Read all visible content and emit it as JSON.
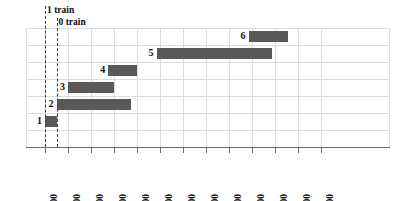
{
  "chart_data": {
    "type": "bar",
    "orientation": "horizontal",
    "title": "",
    "xlabel": "",
    "ylabel": "",
    "grid": true,
    "legend_position": "none",
    "x_axis": {
      "tick_labels": [
        "9:00",
        "10:00",
        "11:00",
        "12:00",
        "13:00",
        "14:00",
        "15:00",
        "16:00",
        "17:00",
        "18:00",
        "19:00",
        "20:00",
        "21:00"
      ],
      "tick_values": [
        9,
        10,
        11,
        12,
        13,
        14,
        15,
        16,
        17,
        18,
        19,
        20,
        21
      ],
      "range": [
        9,
        21.5
      ]
    },
    "y_axis": {
      "tick_labels": [],
      "range": [
        0,
        7
      ]
    },
    "bars": [
      {
        "label": "1",
        "row": 6,
        "start": 9.0,
        "end": 9.5
      },
      {
        "label": "2",
        "row": 5,
        "start": 9.5,
        "end": 12.75
      },
      {
        "label": "3",
        "row": 4,
        "start": 10.0,
        "end": 12.0
      },
      {
        "label": "4",
        "row": 3,
        "start": 11.75,
        "end": 13.0
      },
      {
        "label": "5",
        "row": 2,
        "start": 13.85,
        "end": 18.85
      },
      {
        "label": "6",
        "row": 1,
        "start": 17.85,
        "end": 19.55
      }
    ],
    "annotations": [
      {
        "name": "1 train",
        "text": "1 train",
        "x": 9.0
      },
      {
        "name": "0 train",
        "text": "0 train",
        "x": 9.5
      }
    ],
    "colors": {
      "bar": "#595959",
      "grid": "#d8dce3",
      "axis": "#6d6d6d",
      "text": "#111111",
      "dash": "#3a3a3a",
      "background": "#ffffff"
    }
  }
}
